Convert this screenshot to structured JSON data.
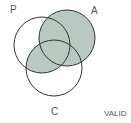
{
  "diagram": {
    "type": "venn",
    "sets": [
      "P",
      "A",
      "C"
    ],
    "shaded_regions": [
      "A only",
      "P∩A",
      "A∩C",
      "P∩C",
      "P∩A∩C"
    ],
    "shade_color": "#b9c8c0",
    "verdict": "VALID"
  },
  "labels": {
    "p": "P",
    "a": "A",
    "c": "C",
    "valid": "VALID"
  }
}
